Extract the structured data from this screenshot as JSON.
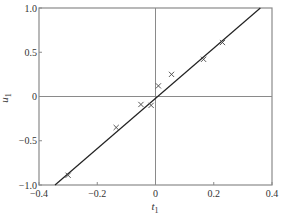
{
  "chart_data": {
    "type": "scatter",
    "title": "",
    "xlabel": "t1",
    "ylabel": "u1",
    "xlabel_base": "t",
    "xlabel_sub": "1",
    "ylabel_base": "u",
    "ylabel_sub": "1",
    "xlim": [
      -0.4,
      0.4
    ],
    "ylim": [
      -1.0,
      1.0
    ],
    "xticks": [
      -0.4,
      -0.2,
      0,
      0.2,
      0.4
    ],
    "xtick_labels": [
      "-0.4",
      "-0.2",
      "0",
      "0.2",
      "0.4"
    ],
    "yticks": [
      -1.0,
      -0.5,
      0,
      0.5,
      1.0
    ],
    "ytick_labels": [
      "-1.0",
      "-0.5",
      "0",
      "0.5",
      "1.0"
    ],
    "grid": false,
    "zero_lines": true,
    "legend": null,
    "series": [
      {
        "name": "observations",
        "marker": "x",
        "x": [
          -0.3,
          -0.135,
          -0.05,
          -0.015,
          0.01,
          0.055,
          0.165,
          0.23
        ],
        "y": [
          -0.89,
          -0.35,
          -0.09,
          -0.1,
          0.12,
          0.25,
          0.42,
          0.61
        ]
      },
      {
        "name": "fitted line",
        "type": "line",
        "x": [
          -0.345,
          0.36
        ],
        "y": [
          -1.0,
          1.0
        ],
        "slope": 2.85
      }
    ]
  }
}
